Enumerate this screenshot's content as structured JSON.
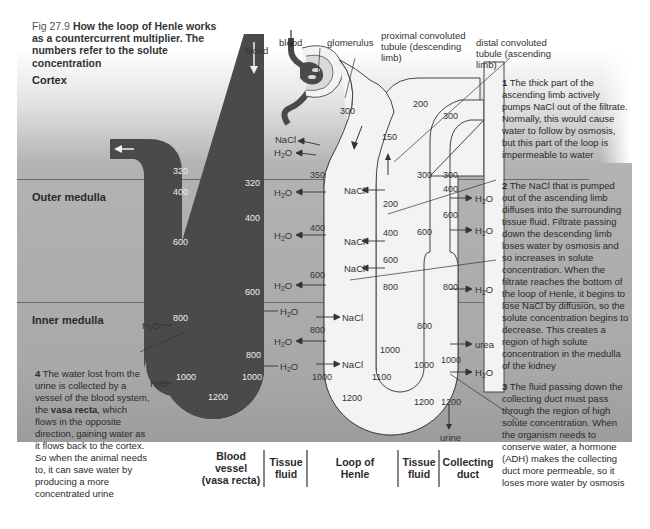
{
  "figure": {
    "number": "Fig 27.9",
    "title": "How the loop of Henle works as a countercurrent multiplier. The numbers refer to the solute concentration"
  },
  "zones": {
    "cortex": "Cortex",
    "outer_medulla": "Outer medulla",
    "inner_medulla": "Inner medulla"
  },
  "labels": {
    "blood_vessel_top": "blood",
    "blood_glomerulus": "blood",
    "glomerulus": "glomerulus",
    "proximal": "proximal convoluted tubule (descending limb)",
    "proximal_l1": "proximal convoluted",
    "proximal_l2": "tubule (descending",
    "proximal_l3": "limb)",
    "distal_l1": "distal convoluted",
    "distal_l2": "tubule (ascending",
    "distal_l3": "limb)",
    "urine": "urine",
    "nacl": "NaCl",
    "h2o_h": "H",
    "h2o_sub": "2",
    "h2o_o": "O",
    "urea": "urea"
  },
  "vasa_recta": {
    "descending_values": [
      "320",
      "400",
      "600",
      "800",
      "1000"
    ],
    "bottom_value": "1200",
    "ascending_values": [
      "320",
      "400",
      "600",
      "800",
      "1000"
    ]
  },
  "loop_of_henle": {
    "descending_values": [
      "300",
      "350",
      "400",
      "600",
      "800",
      "1000"
    ],
    "bottom_value": "1200",
    "ascending_values": [
      "1100",
      "1000",
      "800",
      "600",
      "400",
      "200",
      "150"
    ],
    "distal_value": "200"
  },
  "tissue_fluid": {
    "values": [
      "300",
      "600",
      "800",
      "1000",
      "1200"
    ]
  },
  "collecting_duct": {
    "values": [
      "300",
      "300",
      "400",
      "600",
      "800",
      "1000",
      "1200"
    ]
  },
  "notes": {
    "n1_num": "1",
    "n1_text": "The thick part of the ascending limb actively pumps NaCl out of the filtrate. Normally, this would cause water to follow by osmosis, but this part of the loop is impermeable to water",
    "n2_num": "2",
    "n2_text": "The NaCl that is pumped out of the ascending limb diffuses into the surrounding tissue fluid. Filtrate passing down the descending limb loses water by osmosis and so increases in solute concentration. When the filtrate reaches the bottom of the loop of Henle, it begins to lose NaCl by diffusion, so the solute concentration begins to decrease. This creates a region of high solute concentration in the medulla of the kidney",
    "n3_num": "3",
    "n3_text": "The fluid passing down the collecting duct must pass through the region of high solute concentration. When the organism needs to conserve water, a hormone (ADH) makes the collecting duct more permeable, so it loses more water by osmosis",
    "n4_num": "4",
    "n4_text_a": "The water lost from the urine is collected by a vessel of the blood system, the",
    "n4_bold": "vasa recta",
    "n4_text_b": ", which flows in the opposite direction, gaining water as it flows back to the cortex. So when the animal needs to, it can save water by producing a more concentrated urine"
  },
  "columns": {
    "blood_vessel": "Blood vessel (vasa recta)",
    "blood_vessel_l1": "Blood",
    "blood_vessel_l2": "vessel",
    "blood_vessel_l3": "(vasa recta)",
    "tissue_fluid_1_l1": "Tissue",
    "tissue_fluid_1_l2": "fluid",
    "loop_l1": "Loop of",
    "loop_l2": "Henle",
    "tissue_fluid_2_l1": "Tissue",
    "tissue_fluid_2_l2": "fluid",
    "collecting_l1": "Collecting",
    "collecting_l2": "duct"
  },
  "colors": {
    "vessel_dark": "#4a4a4a",
    "tubule_light": "#f3f3f3",
    "medulla_bg": "#a9a9a9",
    "cortex_top": "#ffffff"
  }
}
